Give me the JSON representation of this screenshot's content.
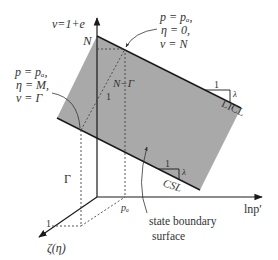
{
  "diagram": {
    "colors": {
      "surface_fill": "#a9a9a9",
      "line": "#1a1a1a",
      "dashed": "#444444",
      "text": "#333333"
    },
    "axes": {
      "vertical_label": "ν=1+e",
      "horizontal_label": "lnp′",
      "depth_label": "ζ(η)"
    },
    "labels": {
      "N": "N",
      "N_minus_Gamma": "N−Γ",
      "Gamma": "Γ",
      "p_a": "pₐ",
      "slope_one_top": "1",
      "slope_one_left": "1",
      "depth_one": "1",
      "licl": "LICL",
      "csl": "CSL",
      "licl_run": "1",
      "licl_rise": "λ",
      "csl_run": "1",
      "csl_rise": "λ",
      "surface_line1": "state boundary",
      "surface_line2": "surface"
    },
    "annotations": {
      "top_right": [
        "p = pₐ,",
        "η = 0,",
        "ν = N"
      ],
      "left": [
        "p = pₐ,",
        "η = M,",
        "ν = Γ"
      ]
    }
  }
}
